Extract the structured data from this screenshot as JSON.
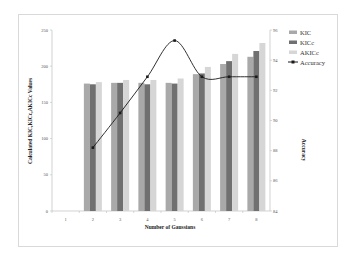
{
  "chart_data": {
    "type": "bar",
    "title": "",
    "xlabel": "Number of Gaussians",
    "ylabel": "Calculated KIC,KICc,AKICc Values",
    "y2label": "Accuracy",
    "categories": [
      "1",
      "2",
      "3",
      "4",
      "5",
      "6",
      "7",
      "8"
    ],
    "ylim": [
      0,
      250
    ],
    "yticks": [
      0,
      50,
      100,
      150,
      200,
      250
    ],
    "y2lim": [
      84,
      96
    ],
    "y2ticks": [
      84,
      86,
      88,
      90,
      92,
      94,
      96
    ],
    "grid": false,
    "legend_position": "right",
    "series": [
      {
        "name": "KIC",
        "type": "bar",
        "axis": "left",
        "color": "#a9a9a9",
        "values": [
          null,
          176,
          177,
          177,
          177,
          189,
          203,
          213
        ]
      },
      {
        "name": "KICc",
        "type": "bar",
        "axis": "left",
        "color": "#707070",
        "values": [
          null,
          175,
          177,
          175,
          176,
          190,
          207,
          221
        ]
      },
      {
        "name": "AKICc",
        "type": "bar",
        "axis": "left",
        "color": "#d6d6d6",
        "values": [
          null,
          178,
          181,
          181,
          183,
          199,
          217,
          232
        ]
      },
      {
        "name": "Accuracy",
        "type": "line",
        "axis": "right",
        "color": "#1a1a1a",
        "values": [
          null,
          88.2,
          90.5,
          92.9,
          95.3,
          92.9,
          92.9,
          92.9
        ]
      }
    ]
  }
}
